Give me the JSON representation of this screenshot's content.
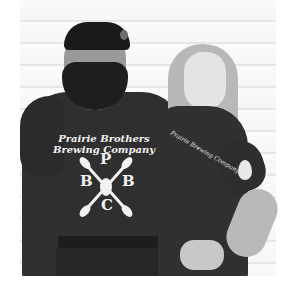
{
  "image": {
    "description": "Two people posing against white horizontal siding wearing dark gray brewery t-shirts",
    "background": "white horizontal wood siding"
  },
  "man": {
    "shirt_text_line1": "Prairie Brothers",
    "shirt_text_line2": "Brewing Company",
    "emblem_letters": [
      "P",
      "B",
      "B",
      "C"
    ]
  },
  "woman": {
    "chest_text": "Prairie Brewing Company"
  },
  "colors": {
    "shirt": "#2f2f2f",
    "print": "#f0f0f0",
    "wall": "#f8f8f8"
  }
}
